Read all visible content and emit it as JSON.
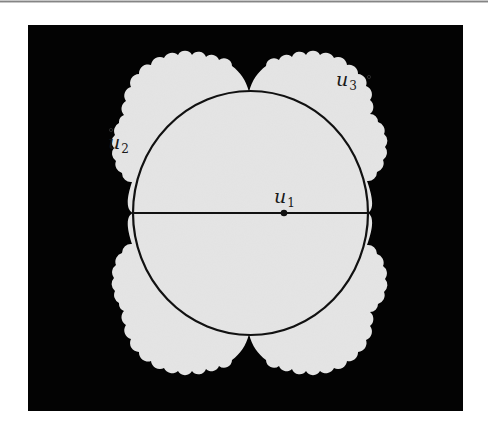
{
  "figure": {
    "colors": {
      "background": "#030303",
      "fill": "#e4e4e4",
      "stroke": "#111111",
      "page": "#ffffff"
    },
    "frame": {
      "x": 28,
      "y": 25,
      "width": 435,
      "height": 386
    },
    "circle": {
      "cx": 250.5,
      "cy": 213,
      "rx": 117.5,
      "ry": 122
    },
    "diameter": {
      "x1": 133,
      "y1": 213,
      "x2": 368,
      "y2": 213
    },
    "point_u1": {
      "x": 284,
      "y": 213
    },
    "labels": [
      {
        "id": "u1",
        "base": "u",
        "sub": "1",
        "x": 274,
        "y": 188
      },
      {
        "id": "u2",
        "base": "u",
        "sub": "2",
        "x": 109,
        "y": 133
      },
      {
        "id": "u3",
        "base": "u",
        "sub": "3",
        "x": 337,
        "y": 72
      }
    ],
    "small_circles": [
      {
        "id": "u2-marker",
        "x": 111,
        "y": 130
      },
      {
        "id": "u3-marker",
        "x": 369,
        "y": 77
      }
    ]
  }
}
